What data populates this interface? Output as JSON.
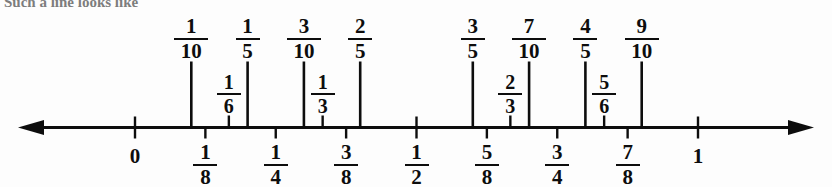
{
  "figure": {
    "clipped_header_text": "Such a line looks like",
    "axis": {
      "start_label": "0",
      "end_label": "1",
      "left_arrow": "left-arrowhead",
      "right_arrow": "right-arrowhead",
      "line_color": "#0d0d0d",
      "background": "#fdfdfd"
    }
  },
  "chart_data": {
    "type": "numberline",
    "xlim": [
      0,
      1
    ],
    "axis_pixel_range": [
      135,
      698
    ],
    "grid": false,
    "tiers": [
      {
        "name": "tenths-and-fifths",
        "position": "above",
        "tick_height": 66,
        "marks": [
          {
            "label_num": "1",
            "label_den": "10",
            "value": 0.1
          },
          {
            "label_num": "1",
            "label_den": "5",
            "value": 0.2
          },
          {
            "label_num": "3",
            "label_den": "10",
            "value": 0.3
          },
          {
            "label_num": "2",
            "label_den": "5",
            "value": 0.4
          },
          {
            "label_num": "3",
            "label_den": "5",
            "value": 0.6
          },
          {
            "label_num": "7",
            "label_den": "10",
            "value": 0.7
          },
          {
            "label_num": "4",
            "label_den": "5",
            "value": 0.8
          },
          {
            "label_num": "9",
            "label_den": "10",
            "value": 0.9
          }
        ]
      },
      {
        "name": "thirds-and-sixths",
        "position": "above",
        "tick_height": 12,
        "marks": [
          {
            "label_num": "1",
            "label_den": "6",
            "value": 0.1667
          },
          {
            "label_num": "1",
            "label_den": "3",
            "value": 0.3333
          },
          {
            "label_num": "2",
            "label_den": "3",
            "value": 0.6667
          },
          {
            "label_num": "5",
            "label_den": "6",
            "value": 0.8333
          }
        ]
      },
      {
        "name": "eighths-quarters-halves",
        "position": "below",
        "tick_height": 11,
        "marks": [
          {
            "label_num": "1",
            "label_den": "8",
            "value": 0.125
          },
          {
            "label_num": "1",
            "label_den": "4",
            "value": 0.25
          },
          {
            "label_num": "3",
            "label_den": "8",
            "value": 0.375
          },
          {
            "label_num": "1",
            "label_den": "2",
            "value": 0.5
          },
          {
            "label_num": "5",
            "label_den": "8",
            "value": 0.625
          },
          {
            "label_num": "3",
            "label_den": "4",
            "value": 0.75
          },
          {
            "label_num": "7",
            "label_den": "8",
            "value": 0.875
          }
        ]
      },
      {
        "name": "endpoints",
        "position": "below",
        "tick_height": 11,
        "marks": [
          {
            "label_num": "0",
            "label_den": "",
            "value": 0
          },
          {
            "label_num": "1",
            "label_den": "",
            "value": 1
          }
        ]
      }
    ]
  }
}
